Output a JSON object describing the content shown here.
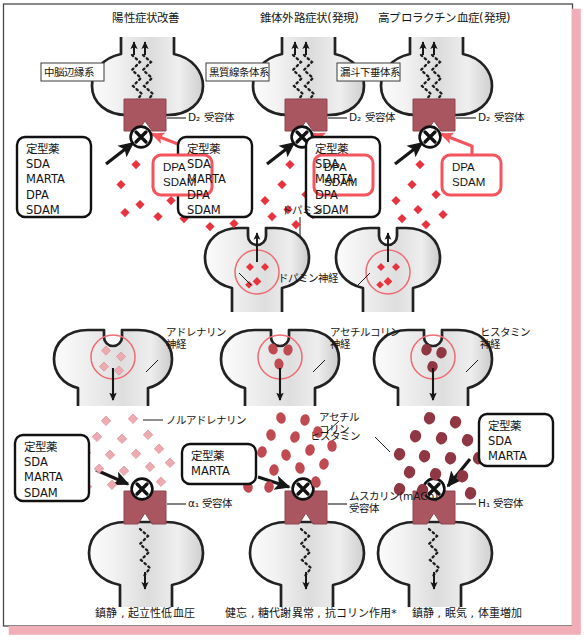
{
  "figure": {
    "type": "pharmacology-mechanism-diagram",
    "language": "ja",
    "title_top": "抗精神病薬の受容体遮断作用と臨床効果・副作用",
    "frame": {
      "border_color": "#4a4a4a",
      "accent_band_color": "#f2aeb6",
      "receptor_color": "#a95660",
      "transmitter_red": "#e8333f",
      "transmitter_pink": "#edaab0",
      "transmitter_darkred": "#8f3844",
      "transmitter_rose": "#c04a52",
      "callout_red": "#f4545c"
    }
  },
  "top_row": {
    "columns": [
      {
        "id": "mesolimbic",
        "heading": "陽性症状改善",
        "pathway_label": "中脳辺縁系",
        "receptor_label": "D₂ 受容体",
        "drug_box": {
          "lines": [
            "定型薬",
            "SDA",
            "MARTA",
            "DPA",
            "SDAM"
          ]
        },
        "agonist_box": {
          "lines": [
            "DPA",
            "SDAM"
          ]
        },
        "blocker_symbol": "✕"
      },
      {
        "id": "nigrostriatal",
        "heading": "錐体外路症状(発現)",
        "pathway_label": "黒質線条体系",
        "receptor_label": "D₂ 受容体",
        "drug_box": {
          "lines": [
            "定型薬",
            "SDA",
            "MARTA",
            "DPA",
            "SDAM"
          ]
        },
        "agonist_box": {
          "lines": [
            "DPA",
            "SDAM"
          ]
        },
        "blocker_symbol": "✕"
      },
      {
        "id": "tuberoinfundibular",
        "heading": "高プロラクチン血症(発現)",
        "pathway_label": "漏斗下垂体系",
        "receptor_label": "D₂ 受容体",
        "drug_box": {
          "lines": [
            "定型薬",
            "SDA",
            "MARTA",
            "DPA",
            "SDAM"
          ]
        },
        "agonist_box": {
          "lines": [
            "DPA",
            "SDAM"
          ]
        },
        "blocker_symbol": "✕"
      }
    ],
    "shared_labels": {
      "transmitter": "ドパミン",
      "neuron": "ドパミン神経"
    }
  },
  "bottom_row": {
    "columns": [
      {
        "id": "alpha1",
        "neuron_label": "アドレナリン\n神経",
        "transmitter_label": "ノルアドレナリン",
        "receptor_label": "α₁ 受容体",
        "drug_box": {
          "lines": [
            "定型薬",
            "SDA",
            "MARTA",
            "SDAM"
          ]
        },
        "effect_caption": "鎮静 , 起立性低血圧",
        "blocker_symbol": "✕"
      },
      {
        "id": "mach",
        "neuron_label": "アセチルコリン\n神経",
        "transmitter_label": "アセチル\nコリン",
        "receptor_label": "ムスカリン(mACh)\n受容体",
        "drug_box": {
          "lines": [
            "定型薬",
            "MARTA"
          ]
        },
        "effect_caption": "健忘 , 糖代謝異常 , 抗コリン作用*",
        "blocker_symbol": "✕"
      },
      {
        "id": "h1",
        "neuron_label": "ヒスタミン\n神経",
        "transmitter_label": "ヒスタミン",
        "receptor_label": "H₁ 受容体",
        "drug_box": {
          "lines": [
            "定型薬",
            "SDA",
            "MARTA"
          ]
        },
        "effect_caption": "鎮静 , 眠気 , 体重増加",
        "blocker_symbol": "✕"
      }
    ]
  }
}
